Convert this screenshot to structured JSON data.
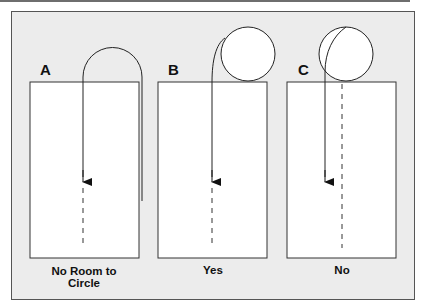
{
  "figure": {
    "panels": [
      {
        "letter": "A",
        "caption_line1": "No Room to",
        "caption_line2": "Circle"
      },
      {
        "letter": "B",
        "caption_line1": "Yes",
        "caption_line2": ""
      },
      {
        "letter": "C",
        "caption_line1": "No",
        "caption_line2": ""
      }
    ],
    "colors": {
      "background": "#ececec",
      "box_fill": "#ffffff",
      "stroke": "#222222"
    }
  }
}
